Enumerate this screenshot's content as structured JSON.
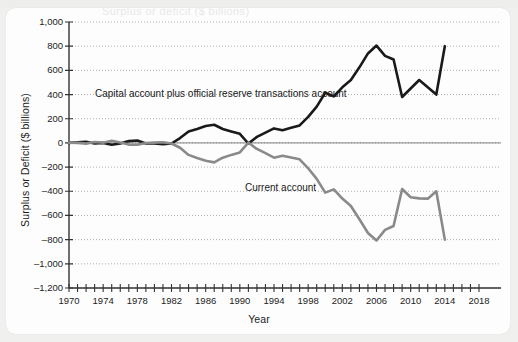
{
  "figure": {
    "background_color": "#f0f0ef",
    "card_color": "#fdfdfd",
    "cropped_title": "Surplus or deficit ($ billions)"
  },
  "chart_data": {
    "type": "line",
    "title": "",
    "xlabel": "Year",
    "ylabel": "Surplus or Deficit ($ billions)",
    "xlim": [
      1970,
      2018
    ],
    "ylim": [
      -1200,
      1000
    ],
    "grid": true,
    "grid_style": "dotted-horizontal",
    "legend_position": "inline-annotations",
    "y_ticks": [
      "1,000",
      "800",
      "600",
      "400",
      "200",
      "0",
      "-200",
      "-400",
      "-600",
      "-800",
      "-1,000",
      "-1,200"
    ],
    "y_tick_values": [
      1000,
      800,
      600,
      400,
      200,
      0,
      -200,
      -400,
      -600,
      -800,
      -1000,
      -1200
    ],
    "x_ticks": [
      "1970",
      "1974",
      "1978",
      "1982",
      "1986",
      "1990",
      "1994",
      "1998",
      "2002",
      "2006",
      "2010",
      "2014",
      "2018"
    ],
    "x_tick_values": [
      1970,
      1974,
      1978,
      1982,
      1986,
      1990,
      1994,
      1998,
      2002,
      2006,
      2010,
      2014,
      2018
    ],
    "x_minor_tick_interval": 1,
    "annotations": [
      {
        "text": "Capital account plus official reserve transactions account",
        "x": 1978,
        "y": 440
      },
      {
        "text": "Current account",
        "x": 1996,
        "y": -300
      }
    ],
    "x": [
      1970,
      1971,
      1972,
      1973,
      1974,
      1975,
      1976,
      1977,
      1978,
      1979,
      1980,
      1981,
      1982,
      1983,
      1984,
      1985,
      1986,
      1987,
      1988,
      1989,
      1990,
      1991,
      1992,
      1993,
      1994,
      1995,
      1996,
      1997,
      1998,
      1999,
      2000,
      2001,
      2002,
      2003,
      2004,
      2005,
      2006,
      2007,
      2008,
      2009,
      2010,
      2011,
      2012,
      2013,
      2014
    ],
    "series": [
      {
        "name": "Capital account plus official reserve transactions account",
        "color": "#1a1a1a",
        "linewidth": 2.6,
        "values": [
          0,
          5,
          10,
          -5,
          0,
          -15,
          -5,
          15,
          20,
          -5,
          -5,
          -10,
          -5,
          40,
          95,
          115,
          140,
          150,
          115,
          95,
          75,
          -5,
          50,
          85,
          120,
          105,
          125,
          145,
          215,
          300,
          415,
          385,
          460,
          520,
          625,
          740,
          805,
          720,
          690,
          380,
          450,
          520,
          460,
          400,
          800
        ]
      },
      {
        "name": "Current account",
        "color": "#8a8a8a",
        "linewidth": 2.6,
        "values": [
          2,
          0,
          -6,
          7,
          2,
          18,
          4,
          -14,
          -15,
          -1,
          2,
          5,
          -5,
          -40,
          -99,
          -124,
          -147,
          -161,
          -122,
          -99,
          -79,
          3,
          -50,
          -85,
          -122,
          -106,
          -121,
          -136,
          -210,
          -297,
          -411,
          -384,
          -460,
          -522,
          -631,
          -745,
          -807,
          -719,
          -687,
          -381,
          -449,
          -459,
          -461,
          -400,
          -800
        ]
      }
    ]
  }
}
